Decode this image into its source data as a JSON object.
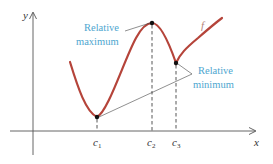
{
  "diagram": {
    "axes": {
      "x_label": "x",
      "y_label": "y"
    },
    "function_label": "f",
    "tick_labels": [
      {
        "base": "c",
        "sub": "1"
      },
      {
        "base": "c",
        "sub": "2"
      },
      {
        "base": "c",
        "sub": "3"
      }
    ],
    "annotations": {
      "maximum": {
        "line1": "Relative",
        "line2": "maximum"
      },
      "minimum": {
        "line1": "Relative",
        "line2": "minimum"
      }
    },
    "colors": {
      "curve": "#b5443a",
      "annotation": "#4ea6cf",
      "axes": "#555555"
    }
  }
}
